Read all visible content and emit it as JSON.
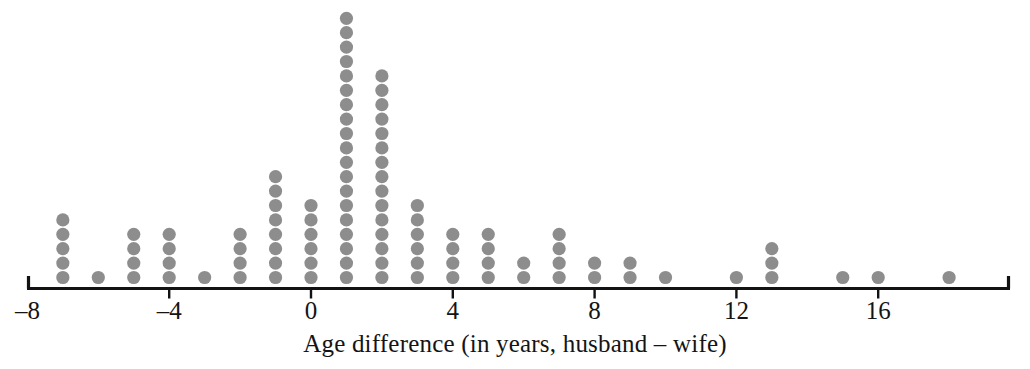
{
  "chart_data": {
    "type": "scatter",
    "plot_style": "dotplot",
    "title": "",
    "subtitle": "",
    "xlabel": "Age difference (in years, husband – wife)",
    "ylabel": "",
    "xlim": [
      -8,
      18.5
    ],
    "ylim": [
      0,
      19
    ],
    "grid": false,
    "legend": null,
    "annotations": [],
    "x_tick_labels": [
      "–8",
      "–4",
      "0",
      "4",
      "8",
      "12",
      "16"
    ],
    "x_tick_values": [
      -8,
      -4,
      0,
      4,
      8,
      12,
      16
    ],
    "x_axis_unit": "years",
    "dot_color": "#8d8d8d",
    "axis_color": "#121212",
    "total_observations": 99,
    "categories": [
      -7,
      -6,
      -5,
      -4,
      -3,
      -2,
      -1,
      0,
      1,
      2,
      3,
      4,
      5,
      6,
      7,
      8,
      9,
      10,
      12,
      13,
      15,
      16,
      18
    ],
    "values": [
      5,
      1,
      4,
      4,
      1,
      4,
      8,
      6,
      19,
      15,
      6,
      4,
      4,
      2,
      4,
      2,
      2,
      1,
      1,
      3,
      1,
      1,
      1
    ]
  },
  "figure": {
    "x_axis_title": "Age difference (in years, husband – wife)"
  }
}
